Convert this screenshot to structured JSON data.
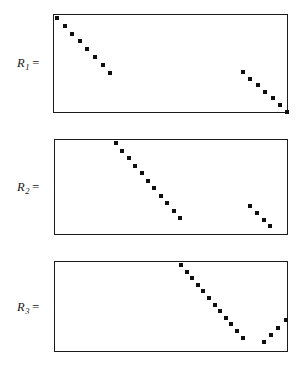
{
  "figure": {
    "background_color": "#ffffff",
    "ink_color": "#0d0f11",
    "border_color": "#1a1c1e",
    "width": 304,
    "height": 371
  },
  "chart_data": {
    "type": "scatter",
    "title": "",
    "xlabel": "",
    "ylabel": "",
    "grid": false,
    "legend": "none",
    "panels": [
      {
        "name": "R1",
        "label_base": "R",
        "label_sub": "1",
        "label_eq": "=",
        "label_text": "R1 =",
        "box": {
          "x": 53,
          "y": 14,
          "width": 235,
          "height": 99
        },
        "segments": [
          {
            "name": "upper-left-diagonal",
            "direction": "down-right",
            "count": 8,
            "start": {
              "x": 54,
              "y": 15
            },
            "step": {
              "x": 7.6,
              "y": 7.8
            }
          },
          {
            "name": "lower-right-diagonal",
            "direction": "down-right",
            "count": 7,
            "start": {
              "x": 240,
              "y": 69
            },
            "step": {
              "x": 7.4,
              "y": 6.6
            }
          }
        ]
      },
      {
        "name": "R2",
        "label_base": "R",
        "label_sub": "2",
        "label_eq": "=",
        "label_text": "R2 =",
        "box": {
          "x": 54,
          "y": 139,
          "width": 234,
          "height": 96
        },
        "segments": [
          {
            "name": "upper-middle-diagonal",
            "direction": "down-right",
            "count": 11,
            "start": {
              "x": 113,
              "y": 140
            },
            "step": {
              "x": 6.4,
              "y": 7.5
            }
          },
          {
            "name": "lower-right-diagonal",
            "direction": "down-right",
            "count": 4,
            "start": {
              "x": 247,
              "y": 203
            },
            "step": {
              "x": 6.8,
              "y": 6.8
            }
          }
        ]
      },
      {
        "name": "R3",
        "label_base": "R",
        "label_sub": "3",
        "label_eq": "=",
        "label_text": "R3 =",
        "box": {
          "x": 54,
          "y": 261,
          "width": 234,
          "height": 91
        },
        "segments": [
          {
            "name": "upper-right-diagonal",
            "direction": "down-right",
            "count": 12,
            "start": {
              "x": 178,
              "y": 262
            },
            "step": {
              "x": 5.6,
              "y": 6.6
            }
          },
          {
            "name": "lower-right-rising-diagonal",
            "direction": "up-right",
            "count": 4,
            "start": {
              "x": 261,
              "y": 339
            },
            "step": {
              "x": 7.2,
              "y": -7.2
            }
          }
        ]
      }
    ]
  },
  "labels": {
    "r1": {
      "base": "R",
      "sub": "1",
      "eq": "=",
      "x": 17,
      "y": 56
    },
    "r2": {
      "base": "R",
      "sub": "2",
      "eq": "=",
      "x": 17,
      "y": 180
    },
    "r3": {
      "base": "R",
      "sub": "3",
      "eq": "=",
      "x": 17,
      "y": 300
    }
  }
}
